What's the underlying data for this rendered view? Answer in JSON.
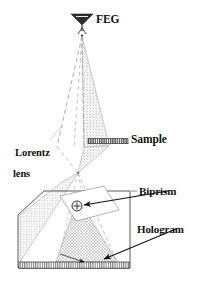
{
  "figure": {
    "title_fragment": "",
    "background_color": "#ffffff",
    "ink_color": "#1a1a1a"
  },
  "labels": {
    "feg": "FEG",
    "sample": "Sample",
    "lorentz_line1": "Lorentz",
    "lorentz_line2": "lens",
    "biprism": "Biprism",
    "hologram": "Hologram"
  },
  "components": {
    "electron_source": {
      "name": "field-emission-gun",
      "label": "FEG",
      "shape": "inverted-triangle-with-filament"
    },
    "specimen": {
      "name": "sample",
      "label": "Sample",
      "shape": "hatched-horizontal-bar"
    },
    "objective": {
      "name": "lorentz-lens",
      "label": "Lorentz lens",
      "shape": "shaded-beam-cone"
    },
    "interferometer": {
      "name": "biprism",
      "label": "Biprism",
      "shape": "circle-with-plus"
    },
    "detector": {
      "name": "hologram-plane",
      "label": "Hologram",
      "shape": "hatched-strip"
    }
  },
  "beam": {
    "upper_cone_color": "#8c8c8c",
    "lower_cone_color": "#8c8c8c",
    "crossover_label": "crossover"
  }
}
